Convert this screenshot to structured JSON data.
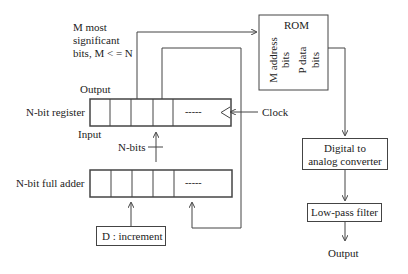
{
  "labels": {
    "msb_line1": "M most",
    "msb_line2": "significant",
    "msb_line3": "bits, M < = N",
    "register_output": "Output",
    "register": "N-bit register",
    "register_input": "Input",
    "clock": "Clock",
    "nbits": "N-bits",
    "adder": "N-bit full adder",
    "increment": "D : increment",
    "register_dots": "-----",
    "adder_dots": "-----",
    "rom_title": "ROM",
    "rom_addr_line1": "M address",
    "rom_addr_line2": "bits",
    "rom_data_line1": "P data",
    "rom_data_line2": "bits",
    "dac_line1": "Digital to",
    "dac_line2": "analog converter",
    "lpf": "Low-pass filter",
    "final_output": "Output"
  }
}
